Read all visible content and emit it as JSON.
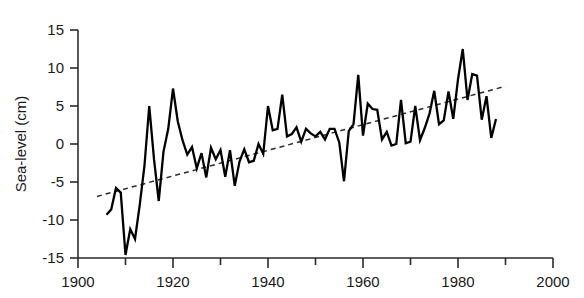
{
  "chart_data": {
    "type": "line",
    "title": "",
    "subtitle": "",
    "xlabel": "",
    "ylabel": "Sea-level (cm)",
    "xlim": [
      1900,
      2000
    ],
    "ylim": [
      -15,
      15
    ],
    "grid": false,
    "legend": "none",
    "x_ticks": [
      1900,
      1920,
      1940,
      1960,
      1980,
      2000
    ],
    "x_tick_labels": [
      "1900",
      "1920",
      "1940",
      "1960",
      "1980",
      "2000"
    ],
    "x_minor_ticks": [
      1910,
      1930,
      1950,
      1970,
      1990
    ],
    "y_ticks": [
      -15,
      -10,
      -5,
      0,
      5,
      10,
      15
    ],
    "y_tick_labels": [
      "-15",
      "-10",
      "-5",
      "0",
      "5",
      "10",
      "15"
    ],
    "series": [
      {
        "name": "Sea-level",
        "style": "solid",
        "color": "#000000",
        "x": [
          1906,
          1907,
          1908,
          1909,
          1910,
          1911,
          1912,
          1913,
          1914,
          1915,
          1916,
          1917,
          1918,
          1919,
          1920,
          1921,
          1922,
          1923,
          1924,
          1925,
          1926,
          1927,
          1928,
          1929,
          1930,
          1931,
          1932,
          1933,
          1934,
          1935,
          1936,
          1937,
          1938,
          1939,
          1940,
          1941,
          1942,
          1943,
          1944,
          1945,
          1946,
          1947,
          1948,
          1949,
          1950,
          1951,
          1952,
          1953,
          1954,
          1955,
          1956,
          1957,
          1958,
          1959,
          1960,
          1961,
          1962,
          1963,
          1964,
          1965,
          1966,
          1967,
          1968,
          1969,
          1970,
          1971,
          1972,
          1973,
          1974,
          1975,
          1976,
          1977,
          1978,
          1979,
          1980,
          1981,
          1982,
          1983,
          1984,
          1985,
          1986,
          1987,
          1988
        ],
        "y": [
          -9.3,
          -8.6,
          -5.8,
          -6.4,
          -14.6,
          -11.2,
          -12.5,
          -8.0,
          -2.8,
          5.0,
          -2.0,
          -7.5,
          -1.0,
          2.0,
          7.3,
          3.0,
          0.5,
          -1.4,
          -0.4,
          -3.2,
          -1.2,
          -4.4,
          -0.5,
          -2.0,
          -0.8,
          -4.3,
          -0.8,
          -5.5,
          -2.3,
          -0.7,
          -2.4,
          -2.2,
          0.0,
          -1.3,
          5.0,
          1.8,
          2.0,
          6.5,
          1.0,
          1.3,
          2.2,
          0.3,
          2.0,
          1.4,
          1.0,
          1.6,
          0.6,
          2.0,
          2.0,
          0.2,
          -4.9,
          1.7,
          2.6,
          9.1,
          1.1,
          5.3,
          4.6,
          4.5,
          0.6,
          1.6,
          -0.2,
          0.0,
          5.8,
          0.1,
          0.3,
          5.0,
          0.5,
          2.1,
          4.0,
          7.0,
          2.6,
          3.1,
          6.9,
          3.3,
          8.5,
          12.5,
          5.8,
          9.2,
          9.0,
          3.2,
          6.3,
          0.8,
          3.3
        ]
      },
      {
        "name": "Linear trend",
        "style": "dashed",
        "color": "#2b2b2b",
        "x": [
          1904,
          1990
        ],
        "y": [
          -6.9,
          7.6
        ]
      }
    ]
  },
  "axes": {
    "y_axis_title": "Sea-level (cm)"
  }
}
